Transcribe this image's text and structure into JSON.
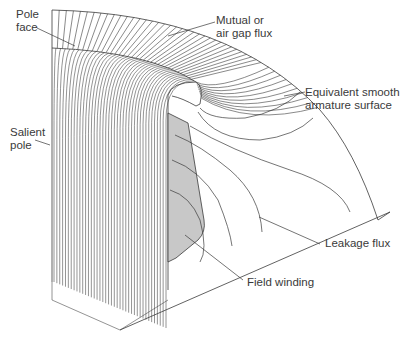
{
  "diagram": {
    "type": "flux-plot",
    "colors": {
      "line": "#3a3a3a",
      "winding_fill": "#c8c8c8",
      "background": "#ffffff"
    }
  },
  "labels": {
    "pole_face": {
      "line1": "Pole",
      "line2": "face"
    },
    "mutual_flux": {
      "line1": "Mutual or",
      "line2": "air gap flux"
    },
    "armature_surface": {
      "line1": "Equivalent smooth",
      "line2": "armature surface"
    },
    "salient_pole": {
      "line1": "Salient",
      "line2": "pole"
    },
    "leakage_flux": {
      "line1": "Leakage flux"
    },
    "field_winding": {
      "line1": "Field winding"
    }
  }
}
